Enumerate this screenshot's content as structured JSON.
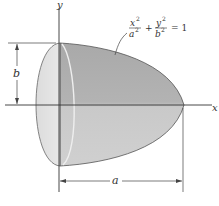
{
  "figure": {
    "axes": {
      "x_label": "x",
      "y_label": "y"
    },
    "equation": {
      "term1_num": "x",
      "term1_den": "a",
      "term1_exp": "2",
      "plus": "+",
      "term2_num": "y",
      "term2_den": "b",
      "term2_exp": "2",
      "rhs": "= 1"
    },
    "dimensions": {
      "height_label": "b",
      "length_label": "a"
    },
    "colors": {
      "body_dark": "#a8a8a8",
      "body_light": "#d6d6d6",
      "face": "#e2e2e2",
      "line": "#3a3a3a"
    }
  }
}
